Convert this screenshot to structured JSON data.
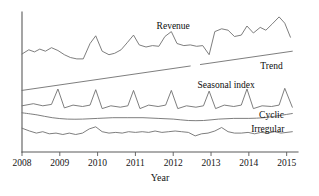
{
  "chart_data": {
    "type": "line",
    "title": "",
    "subtitle": "",
    "xlabel": "Year",
    "ylabel": "",
    "grid": false,
    "legend_position": "inline-right-of-series",
    "xlim": [
      2008,
      2015.3
    ],
    "ylim": [
      0,
      100
    ],
    "tick_labels": [
      "2008",
      "2009",
      "2010",
      "2011",
      "2012",
      "2013",
      "2014",
      "2015"
    ],
    "x_ticks": [
      2008,
      2009,
      2010,
      2011,
      2012,
      2013,
      2014,
      2015
    ],
    "y_axis_visible": true,
    "y_ticks_visible": false,
    "annotations": [
      {
        "name": "revenue-label",
        "text": "Revenue",
        "x": 2012.0,
        "y": 88
      },
      {
        "name": "trend-label",
        "text": "Trend",
        "x": 2014.6,
        "y": 59
      },
      {
        "name": "seasonal-index-label",
        "text": "Seasonal index",
        "x": 2013.4,
        "y": 46
      },
      {
        "name": "cyclic-label",
        "text": "Cyclic",
        "x": 2014.6,
        "y": 24
      },
      {
        "name": "irregular-label",
        "text": "Irregular",
        "x": 2014.5,
        "y": 14
      }
    ],
    "series": [
      {
        "name": "Revenue",
        "label": "Revenue",
        "color": "#6f6f6f",
        "x": [
          2008.0,
          2008.18,
          2008.33,
          2008.47,
          2008.62,
          2008.78,
          2008.95,
          2009.12,
          2009.28,
          2009.45,
          2009.62,
          2009.8,
          2009.95,
          2010.12,
          2010.3,
          2010.45,
          2010.62,
          2010.78,
          2010.95,
          2011.1,
          2011.28,
          2011.45,
          2011.62,
          2011.78,
          2011.95,
          2012.1,
          2012.28,
          2012.45,
          2012.62,
          2012.78,
          2012.95,
          2013.1,
          2013.28,
          2013.45,
          2013.62,
          2013.8,
          2013.95,
          2014.12,
          2014.3,
          2014.45,
          2014.62,
          2014.8,
          2014.95,
          2015.1
        ],
        "y": [
          70,
          73,
          71.5,
          73.5,
          72,
          74.5,
          72.5,
          69.5,
          67.5,
          66.5,
          66.5,
          77.5,
          83,
          72,
          69.5,
          70.5,
          73,
          78,
          83.5,
          76.5,
          75,
          76,
          75.5,
          82.5,
          86,
          77.5,
          76,
          76.5,
          75.5,
          76,
          69.5,
          86,
          88,
          87,
          82.5,
          83.5,
          90,
          85,
          89,
          87,
          91.5,
          96.5,
          92,
          82
        ]
      },
      {
        "name": "Trend",
        "label": "Trend",
        "color": "#6f6f6f",
        "style": "straight-line-with-gap",
        "gap_x": [
          2012.45,
          2012.72
        ],
        "x": [
          2008.0,
          2015.15
        ],
        "y": [
          44,
          72
        ]
      },
      {
        "name": "Seasonal index",
        "label": "Seasonal index",
        "color": "#6f6f6f",
        "style": "sawtooth",
        "peaks_per_year": 1,
        "x": [
          2008.0,
          2008.3,
          2008.55,
          2008.78,
          2008.95,
          2009.12,
          2009.35,
          2009.6,
          2009.8,
          2009.95,
          2010.12,
          2010.35,
          2010.6,
          2010.8,
          2010.95,
          2011.12,
          2011.35,
          2011.6,
          2011.8,
          2011.95,
          2012.12,
          2012.35,
          2012.6,
          2012.8,
          2012.95,
          2013.12,
          2013.35,
          2013.6,
          2013.8,
          2013.95,
          2014.12,
          2014.35,
          2014.6,
          2014.8,
          2014.95,
          2015.15
        ],
        "y": [
          33,
          34.5,
          33,
          34,
          45,
          31.5,
          33.5,
          32.5,
          33.5,
          44.5,
          31,
          33,
          32,
          33,
          44,
          31,
          33.5,
          32.5,
          33.5,
          44,
          31,
          33,
          32,
          33,
          43.5,
          31,
          33.5,
          32.5,
          33.5,
          45,
          31,
          33,
          32.5,
          33.5,
          45.5,
          32
        ]
      },
      {
        "name": "Cyclic",
        "label": "Cyclic",
        "color": "#6f6f6f",
        "style": "smooth-wave",
        "x": [
          2008.0,
          2008.4,
          2008.8,
          2009.2,
          2009.6,
          2010.0,
          2010.4,
          2010.8,
          2011.2,
          2011.6,
          2012.0,
          2012.4,
          2012.8,
          2013.2,
          2013.6,
          2014.0,
          2014.4,
          2014.8,
          2015.15
        ],
        "y": [
          28,
          26.5,
          24.5,
          23.5,
          23.5,
          24,
          24.5,
          24.5,
          24.5,
          24,
          23.5,
          22.5,
          22.5,
          23.5,
          24,
          24,
          24.5,
          26,
          27.5
        ]
      },
      {
        "name": "Irregular",
        "label": "Irregular",
        "color": "#6f6f6f",
        "style": "noisy",
        "x": [
          2008.0,
          2008.2,
          2008.38,
          2008.55,
          2008.72,
          2008.9,
          2009.08,
          2009.25,
          2009.42,
          2009.6,
          2009.78,
          2009.95,
          2010.12,
          2010.3,
          2010.48,
          2010.65,
          2010.82,
          2011.0,
          2011.18,
          2011.35,
          2011.52,
          2011.7,
          2011.88,
          2012.05,
          2012.22,
          2012.4,
          2012.58,
          2012.75,
          2012.92,
          2013.1,
          2013.28,
          2013.45,
          2013.62,
          2013.8,
          2013.98,
          2014.15,
          2014.32,
          2014.5,
          2014.68,
          2014.85,
          2015.15
        ],
        "y": [
          17,
          15,
          13.5,
          14.5,
          13,
          13.5,
          12.5,
          13.5,
          12.5,
          13.5,
          16.5,
          18,
          14.5,
          13.5,
          14,
          13.5,
          14.5,
          14,
          14.5,
          14,
          15,
          14,
          14.5,
          15,
          14.5,
          14,
          11.5,
          13,
          13.5,
          15,
          17.5,
          14.5,
          13.5,
          13.5,
          14,
          13,
          14,
          13.5,
          14.5,
          13.5,
          14.5
        ]
      }
    ]
  }
}
